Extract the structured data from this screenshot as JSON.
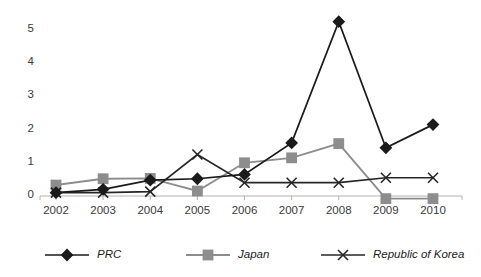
{
  "chart_data": {
    "type": "line",
    "title": "",
    "subtitle": "",
    "xlabel": "",
    "ylabel": "",
    "categories": [
      "2002",
      "2003",
      "2004",
      "2005",
      "2006",
      "2007",
      "2008",
      "2009",
      "2010"
    ],
    "xlim": [
      2002,
      2010
    ],
    "ylim": [
      0,
      5
    ],
    "yticks": [
      0,
      1,
      2,
      3,
      4,
      5
    ],
    "ytick_labels": [
      "0",
      "1",
      "2",
      "3",
      "4",
      "5"
    ],
    "grid": false,
    "legend_position": "bottom",
    "series": [
      {
        "name": "PRC",
        "color": "#1a1a1a",
        "marker": "diamond",
        "values": [
          0.1,
          0.2,
          0.48,
          0.52,
          0.65,
          1.6,
          5.25,
          1.45,
          2.15
        ]
      },
      {
        "name": "Japan",
        "color": "#8d8d8d",
        "marker": "square",
        "values": [
          0.33,
          0.52,
          0.53,
          0.15,
          1.0,
          1.15,
          1.58,
          -0.08,
          -0.08
        ]
      },
      {
        "name": "Republic of Korea",
        "color": "#262626",
        "marker": "x",
        "values": [
          0.1,
          0.1,
          0.13,
          1.25,
          0.4,
          0.4,
          0.4,
          0.55,
          0.55
        ]
      }
    ]
  },
  "legend": {
    "items": [
      {
        "label": "PRC"
      },
      {
        "label": "Japan"
      },
      {
        "label": "Republic of Korea"
      }
    ]
  },
  "axes": {
    "y_labels": [
      "5",
      "4",
      "3",
      "2",
      "1",
      "0"
    ],
    "x_labels": [
      "2002",
      "2003",
      "2004",
      "2005",
      "2006",
      "2007",
      "2008",
      "2009",
      "2010"
    ]
  },
  "colors": {
    "prc": "#1a1a1a",
    "japan": "#8d8d8d",
    "korea": "#262626",
    "axis": "#b4b4b4",
    "text": "#3a3a3a"
  }
}
